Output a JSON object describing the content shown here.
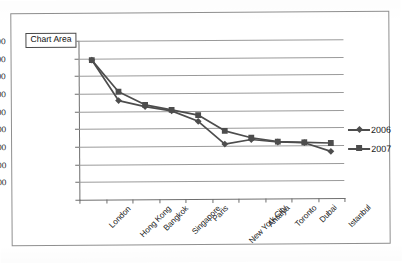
{
  "tooltip": {
    "label": "Chart Area"
  },
  "legend": {
    "position": "right",
    "entries": [
      {
        "label": "2006",
        "marker": "diamond",
        "color": "#4d4d4d"
      },
      {
        "label": "2007",
        "marker": "square",
        "color": "#4d4d4d"
      }
    ]
  },
  "axis": {
    "y_tick_labels": [
      "18,000.00",
      "16,000.00",
      "14,000.00",
      "12,000.00",
      "10,000.00",
      "8,000.00",
      "6,000.00",
      "4,000.00",
      "2,000.00",
      ""
    ]
  },
  "chart_data": {
    "type": "line",
    "title": "",
    "xlabel": "",
    "ylabel": "",
    "ylim": [
      0,
      18000
    ],
    "ytick_step": 2000,
    "grid": true,
    "legend_position": "right",
    "categories": [
      "London",
      "Hong Kong",
      "Bangkok",
      "Singapore",
      "Paris",
      "New York City",
      "Antalya",
      "Toronto",
      "Dubai",
      "Istanbul"
    ],
    "series": [
      {
        "name": "2006",
        "marker": "diamond",
        "color": "#4d4d4d",
        "values": [
          15800,
          11200,
          10500,
          10000,
          8800,
          6200,
          6700,
          6400,
          6300,
          5300
        ]
      },
      {
        "name": "2007",
        "marker": "square",
        "color": "#4d4d4d",
        "values": [
          15800,
          12200,
          10700,
          10100,
          9500,
          7700,
          6900,
          6450,
          6350,
          6250
        ]
      }
    ]
  }
}
